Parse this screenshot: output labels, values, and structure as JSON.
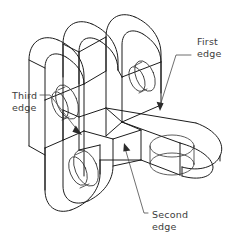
{
  "figure": {
    "background_color": "#ffffff",
    "line_color": "#1c1c1c",
    "leader_color": "#4a4a4a",
    "text_color": "#3c3c3c",
    "width": 243,
    "height": 242
  },
  "callouts": [
    {
      "id": "first-edge",
      "line1": "First",
      "line2": "edge",
      "text_x": 197,
      "text_y": 45,
      "leader_points": "191,55 176,55 160,106",
      "arrow_points": "160,111 156.6,101.8 163.6,103.2"
    },
    {
      "id": "second-edge",
      "line1": "Second",
      "line2": "edge",
      "text_x": 152,
      "text_y": 218,
      "leader_points": "148,213 144,213 125,148",
      "arrow_points": "124,143 130.4,150.6 123.3,151.6"
    },
    {
      "id": "third-edge",
      "line1": "Third",
      "line2": "edge",
      "text_x": 12,
      "text_y": 99,
      "leader_points": "40,95 50,95 78,131",
      "arrow_points": "82,135 72.4,131.8 75.8,125.4"
    }
  ],
  "geometry": {
    "outline": "M 57.5 61.5 L 57.5 36.0 A 26.5 19.0 0 0 1 110.0 36.0 L 110.0 49.0 L 110.0 28.0 A 26.0 19.0 0 0 1 162.0 28.0 L 162.0 92.0 L 196.0 112.0 A 26.5 19.5 0 0 1 196.0 175.0 L 140.0 208.0 L 140.0 176.0 L 110.0 194.0 A 26.5 19.5 0 0 1 57.5 182.0 L 57.5 61.5 Z",
    "description": "Isometric bracket: two vertical pad features at upper left and lower left, a tall vertical rib, and a horizontal arm extending to the lower right ending in a rounded boss with a through hole."
  }
}
